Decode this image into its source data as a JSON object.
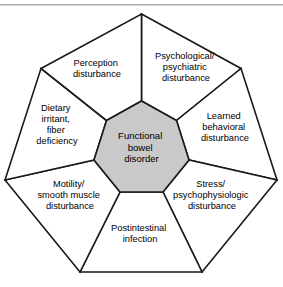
{
  "figure": {
    "core": {
      "name": "functional-bowel-disorder",
      "lines": [
        "Functional",
        "bowel",
        "disorder"
      ],
      "fill_color": "#c9c9c9"
    },
    "outline_color": "#1a1a1a",
    "background_color": "#ffffff",
    "rule_color": "#a8a8a8",
    "sectors": [
      {
        "id": "psychological-psychiatric-disturbance",
        "lines": [
          "Psychological/",
          "psychiatric",
          "disturbance"
        ],
        "label_x": 186,
        "label_y": 68,
        "position": "top-right"
      },
      {
        "id": "learned-behavioral-disturbance",
        "lines": [
          "Learned",
          "behavioral",
          "disturbance"
        ],
        "label_x": 225,
        "label_y": 128,
        "position": "right"
      },
      {
        "id": "stress-psychophysiologic-disturbance",
        "lines": [
          "Stress/",
          "psychophysiologic",
          "disturbance"
        ],
        "label_x": 212,
        "label_y": 196,
        "position": "lower-right"
      },
      {
        "id": "postintestinal-infection",
        "lines": [
          "Postintestinal",
          "infection"
        ],
        "label_x": 140,
        "label_y": 234,
        "position": "bottom"
      },
      {
        "id": "motility-smooth-muscle-disturbance",
        "lines": [
          "Motility/",
          "smooth muscle",
          "disturbance"
        ],
        "label_x": 70,
        "label_y": 196,
        "position": "lower-left"
      },
      {
        "id": "dietary-irritant-fiber-deficiency",
        "lines": [
          "Dietary",
          "irritant,",
          "fiber",
          "deficiency"
        ],
        "label_x": 57,
        "label_y": 126,
        "position": "left"
      },
      {
        "id": "perception-disturbance",
        "lines": [
          "Perception",
          "disturbance"
        ],
        "label_x": 97,
        "label_y": 69,
        "position": "top-left"
      }
    ],
    "geometry": {
      "outer_vertices": [
        [
          141.5,
          14
        ],
        [
          241.0,
          68.5
        ],
        [
          277.0,
          180.0
        ],
        [
          202.0,
          272.0
        ],
        [
          80.0,
          272.0
        ],
        [
          5.0,
          180.0
        ],
        [
          41.0,
          68.5
        ]
      ],
      "inner_vertices": [
        [
          141.5,
          101.0
        ],
        [
          176.5,
          120.5
        ],
        [
          189.0,
          160.0
        ],
        [
          163.0,
          192.0
        ],
        [
          120.0,
          192.0
        ],
        [
          94.0,
          160.0
        ],
        [
          106.5,
          120.5
        ]
      ]
    }
  }
}
